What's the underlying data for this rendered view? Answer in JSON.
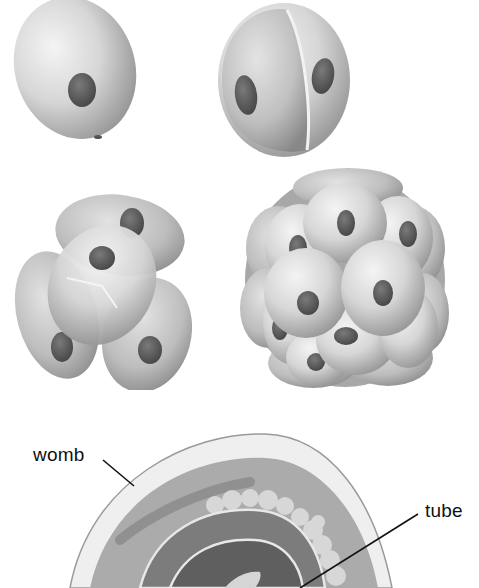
{
  "figure": {
    "stages": [
      {
        "id": "one-cell",
        "cells": 1
      },
      {
        "id": "two-cell",
        "cells": 2
      },
      {
        "id": "four-cell",
        "cells": 4
      },
      {
        "id": "morula",
        "cells": "many"
      }
    ],
    "cross_section": {
      "labels": {
        "womb": "womb",
        "tube": "tube"
      }
    },
    "colors": {
      "background": "#ffffff",
      "cell_light": "#e6e6e6",
      "cell_mid": "#b8b8b8",
      "cell_dark": "#8c8c8c",
      "nucleus": "#5a5a5a",
      "womb_wall": "#f2f2f2",
      "womb_inner": "#a9a9a9",
      "line": "#111111"
    }
  }
}
